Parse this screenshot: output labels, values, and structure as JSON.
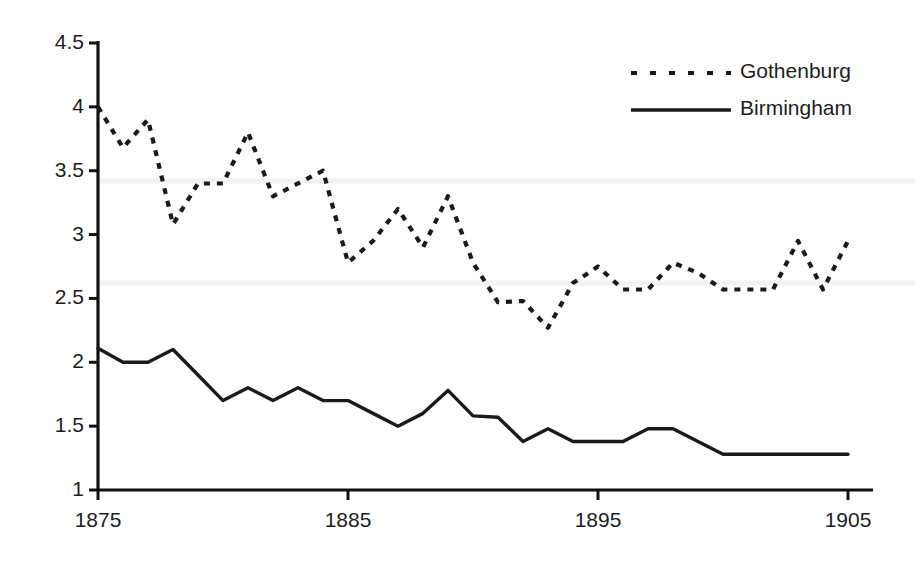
{
  "chart_data": {
    "type": "line",
    "title": "",
    "subtitle": "",
    "xlabel": "",
    "ylabel": "",
    "xlim": [
      1875,
      1905
    ],
    "ylim": [
      1,
      4.5
    ],
    "grid": "faint-horizontal",
    "legend_position": "top-right",
    "x": [
      1875,
      1876,
      1877,
      1878,
      1879,
      1880,
      1881,
      1882,
      1883,
      1884,
      1885,
      1886,
      1887,
      1888,
      1889,
      1890,
      1891,
      1892,
      1893,
      1894,
      1895,
      1896,
      1897,
      1898,
      1899,
      1900,
      1901,
      1902,
      1903,
      1904,
      1905
    ],
    "xtick_labels": [
      "1875",
      "1885",
      "1895",
      "1905"
    ],
    "xtick_values": [
      1875,
      1885,
      1895,
      1905
    ],
    "ytick_labels": [
      "1",
      "1.5",
      "2",
      "2.5",
      "3",
      "3.5",
      "4",
      "4.5"
    ],
    "ytick_values": [
      1,
      1.5,
      2,
      2.5,
      3,
      3.5,
      4,
      4.5
    ],
    "series": [
      {
        "name": "Gothenburg",
        "style": "dotted",
        "color": "#1a1a1a",
        "values": [
          4.0,
          3.68,
          3.9,
          3.08,
          3.4,
          3.4,
          3.8,
          3.3,
          3.4,
          3.5,
          2.78,
          2.95,
          3.2,
          2.9,
          3.3,
          2.78,
          2.47,
          2.48,
          2.27,
          2.62,
          2.75,
          2.57,
          2.57,
          2.78,
          2.7,
          2.57,
          2.57,
          2.57,
          2.95,
          2.57,
          2.95
        ]
      },
      {
        "name": "Birmingham",
        "style": "solid",
        "color": "#1a1a1a",
        "values": [
          2.11,
          2.0,
          2.0,
          2.1,
          1.9,
          1.7,
          1.8,
          1.7,
          1.8,
          1.7,
          1.7,
          1.6,
          1.5,
          1.6,
          1.78,
          1.58,
          1.57,
          1.38,
          1.48,
          1.38,
          1.38,
          1.38,
          1.48,
          1.48,
          1.38,
          1.28,
          1.28,
          1.28,
          1.28,
          1.28,
          1.28
        ]
      }
    ]
  },
  "legend": {
    "items": [
      {
        "label": "Gothenburg",
        "style": "dotted"
      },
      {
        "label": "Birmingham",
        "style": "solid"
      }
    ]
  },
  "axes": {
    "y_ticks": [
      "4.5",
      "4",
      "3.5",
      "3",
      "2.5",
      "2",
      "1.5",
      "1"
    ],
    "x_ticks": [
      "1875",
      "1885",
      "1895",
      "1905"
    ]
  },
  "colors": {
    "line": "#1a1a1a",
    "axis": "#111111",
    "gridline": "#f2f2f4",
    "background": "#ffffff",
    "text": "#1d1d1d"
  }
}
